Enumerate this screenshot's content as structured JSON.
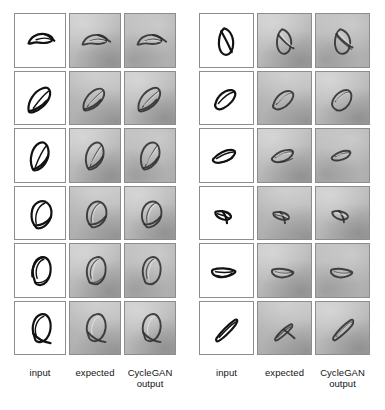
{
  "figure": {
    "type": "image-grid",
    "panels": [
      {
        "id": "left",
        "columns": [
          {
            "key": "input",
            "label": "input",
            "background": "white"
          },
          {
            "key": "expected",
            "label": "expected",
            "background": "gray"
          },
          {
            "key": "cyclegan_output",
            "label": "CycleGAN output",
            "background": "gray"
          }
        ],
        "rows": [
          {
            "index": 1,
            "shape": "flat-elongated-loop-tilted-right"
          },
          {
            "index": 2,
            "shape": "teardrop-loop-tilted-right"
          },
          {
            "index": 3,
            "shape": "tapered-oval-loop-upright"
          },
          {
            "index": 4,
            "shape": "rounded-egg-loop"
          },
          {
            "index": 5,
            "shape": "rounded-loop-double-outline"
          },
          {
            "index": 6,
            "shape": "rounded-loop-with-crossbar"
          }
        ]
      },
      {
        "id": "right",
        "columns": [
          {
            "key": "input",
            "label": "input",
            "background": "white"
          },
          {
            "key": "expected",
            "label": "expected",
            "background": "gray"
          },
          {
            "key": "cyclegan_output",
            "label": "CycleGAN output",
            "background": "gray"
          }
        ],
        "rows": [
          {
            "index": 1,
            "shape": "pointed-oval-with-diagonal-chord"
          },
          {
            "index": 2,
            "shape": "narrow-slanted-oval"
          },
          {
            "index": 3,
            "shape": "thin-tapered-blade"
          },
          {
            "index": 4,
            "shape": "small-arrow-wedge"
          },
          {
            "index": 5,
            "shape": "crescent-sliver"
          },
          {
            "index": 6,
            "shape": "slim-diagonal-loop"
          }
        ]
      }
    ]
  },
  "labels": {
    "input": "input",
    "expected": "expected",
    "cyclegan_line1": "CycleGAN",
    "cyclegan_line2": "output"
  },
  "colors": {
    "page_background": "#ffffff",
    "cell_border": "#8d8d8d",
    "white_cell": "#ffffff",
    "gray_cell": "#bcbcbc",
    "ink": "#111111",
    "label_text": "#141414"
  }
}
